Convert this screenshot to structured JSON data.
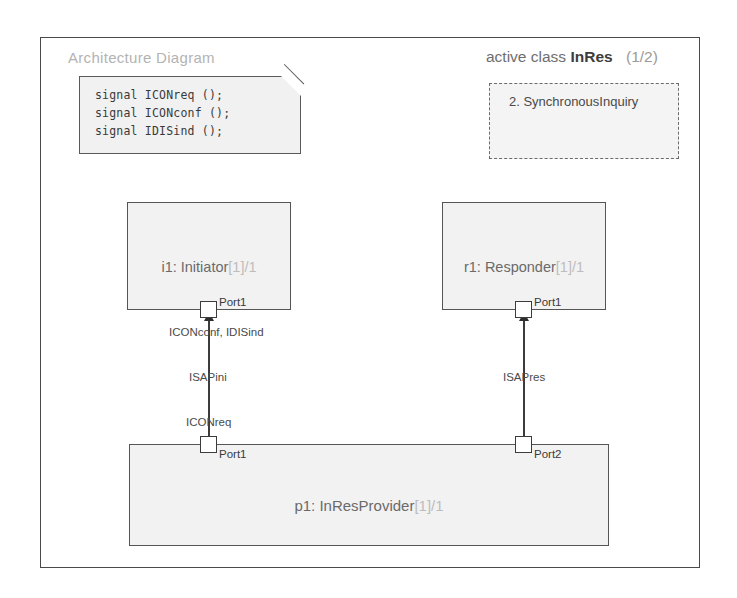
{
  "diagram": {
    "title": "Architecture Diagram",
    "active_class": {
      "keyword": "active class",
      "name": "InRes",
      "index": "(1/2)"
    },
    "note": {
      "signals": [
        "signal ICONreq ();",
        "signal ICONconf ();",
        "signal IDISind ();"
      ]
    },
    "state_box": {
      "label": "2. SynchronousInquiry"
    },
    "blocks": [
      {
        "id": "initiator",
        "label": "i1: Initiator[1]/1",
        "instance": "i1: Initiator",
        "multiplicity": "[1]/1"
      },
      {
        "id": "responder",
        "label": "r1: Responder[1]/1",
        "instance": "r1: Responder",
        "multiplicity": "[1]/1"
      },
      {
        "id": "provider",
        "label": "p1: InResProvider[1]/1",
        "instance": "p1: InResProvider",
        "multiplicity": "[1]/1"
      }
    ],
    "ports": [
      {
        "id": "initiator-port1",
        "label": "Port1"
      },
      {
        "id": "responder-port1",
        "label": "Port1"
      },
      {
        "id": "provider-port1",
        "label": "Port1"
      },
      {
        "id": "provider-port2",
        "label": "Port2"
      }
    ],
    "connectors": [
      {
        "id": "isapini",
        "name": "ISAPini",
        "upper_signals": "ICONconf, IDISind",
        "lower_signals": "ICONreq"
      },
      {
        "id": "isapres",
        "name": "ISAPres"
      }
    ],
    "colors": {
      "frame": "#4a4a4a",
      "block_fill": "#f2f2f2",
      "block_border": "#555555",
      "note_fill": "#f1f1f1",
      "title_text": "#b3b3b3",
      "label_text": "#7b7b7b",
      "connector": "#3c3c3c"
    }
  }
}
